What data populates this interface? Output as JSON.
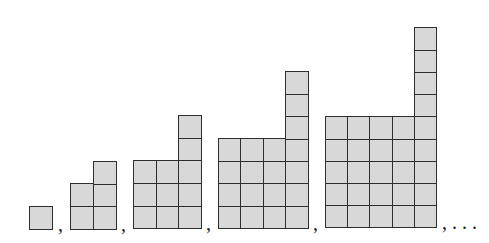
{
  "diagram": {
    "cell_fill": "#d8d8d8",
    "cell_stroke": "#2e2e2e",
    "separator": ",",
    "continuation": ", . . .",
    "figures": [
      {
        "index": 1,
        "square": 1,
        "tower_extra": 0,
        "cells": 1,
        "x": 29,
        "bottom": 229,
        "cell": 23.0
      },
      {
        "index": 2,
        "square": 2,
        "tower_extra": 1,
        "cells": 5,
        "x": 70,
        "bottom": 229,
        "cell": 22.8
      },
      {
        "index": 3,
        "square": 3,
        "tower_extra": 2,
        "cells": 11,
        "x": 133,
        "bottom": 228,
        "cell": 22.6
      },
      {
        "index": 4,
        "square": 4,
        "tower_extra": 3,
        "cells": 19,
        "x": 218,
        "bottom": 228,
        "cell": 22.4
      },
      {
        "index": 5,
        "square": 5,
        "tower_extra": 4,
        "cells": 29,
        "x": 325,
        "bottom": 227,
        "cell": 22.2
      }
    ],
    "separators": [
      {
        "text": ",",
        "x": 58,
        "y": 214
      },
      {
        "text": ",",
        "x": 121,
        "y": 214
      },
      {
        "text": ",",
        "x": 206,
        "y": 213
      },
      {
        "text": ",",
        "x": 313,
        "y": 213
      },
      {
        "text": ", . . .",
        "x": 442,
        "y": 212
      }
    ]
  }
}
